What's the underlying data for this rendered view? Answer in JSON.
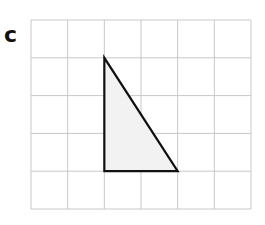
{
  "label": "c",
  "grid": {
    "columns": 6,
    "rows": 5,
    "x0": 31,
    "y0": 20,
    "x1": 251,
    "y1": 209,
    "line_color": "#c8c8c8"
  },
  "triangle": {
    "vertices_grid": [
      [
        2,
        1
      ],
      [
        2,
        4
      ],
      [
        4,
        4
      ]
    ],
    "stroke": "#111111",
    "fill": "#f2f2f2"
  }
}
